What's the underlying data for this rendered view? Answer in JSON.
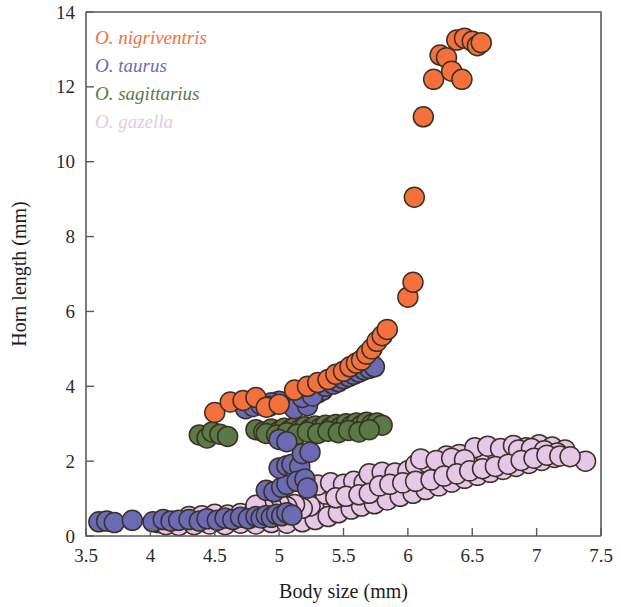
{
  "chart_data": {
    "type": "scatter",
    "title": "",
    "xlabel": "Body size (mm)",
    "ylabel": "Horn length (mm)",
    "xlim": [
      3.5,
      7.5
    ],
    "ylim": [
      0,
      14
    ],
    "xticks": [
      "3.5",
      "4",
      "4.5",
      "5",
      "5.5",
      "6",
      "6.5",
      "7",
      "7.5"
    ],
    "xtick_values": [
      3.5,
      4,
      4.5,
      5,
      5.5,
      6,
      6.5,
      7,
      7.5
    ],
    "yticks": [
      "0",
      "2",
      "4",
      "6",
      "8",
      "10",
      "12",
      "14"
    ],
    "ytick_values": [
      0,
      2,
      4,
      6,
      8,
      10,
      12,
      14
    ],
    "grid": false,
    "legend_position": "top-left",
    "marker_radius_px": 10,
    "marker_stroke": "#3b3026",
    "series": [
      {
        "name": "O. nigriventris",
        "color": "#F4713E",
        "points": [
          [
            4.5,
            3.3
          ],
          [
            4.62,
            3.58
          ],
          [
            4.72,
            3.62
          ],
          [
            4.82,
            3.7
          ],
          [
            4.9,
            3.44
          ],
          [
            5.0,
            3.52
          ],
          [
            5.12,
            3.9
          ],
          [
            5.22,
            4.0
          ],
          [
            5.3,
            4.1
          ],
          [
            5.38,
            4.18
          ],
          [
            5.44,
            4.32
          ],
          [
            5.5,
            4.4
          ],
          [
            5.55,
            4.52
          ],
          [
            5.6,
            4.62
          ],
          [
            5.64,
            4.7
          ],
          [
            5.68,
            4.86
          ],
          [
            5.72,
            5.0
          ],
          [
            5.76,
            5.2
          ],
          [
            5.8,
            5.35
          ],
          [
            5.84,
            5.52
          ],
          [
            6.0,
            6.38
          ],
          [
            6.04,
            6.78
          ],
          [
            6.05,
            9.05
          ],
          [
            6.12,
            11.2
          ],
          [
            6.2,
            12.2
          ],
          [
            6.25,
            12.85
          ],
          [
            6.3,
            12.78
          ],
          [
            6.34,
            12.42
          ],
          [
            6.42,
            12.2
          ],
          [
            6.38,
            13.25
          ],
          [
            6.44,
            13.3
          ],
          [
            6.5,
            13.22
          ],
          [
            6.54,
            13.1
          ],
          [
            6.57,
            13.18
          ]
        ]
      },
      {
        "name": "O. taurus",
        "color": "#6B6BB5",
        "points": [
          [
            3.6,
            0.38
          ],
          [
            3.66,
            0.4
          ],
          [
            3.72,
            0.36
          ],
          [
            3.86,
            0.42
          ],
          [
            4.02,
            0.38
          ],
          [
            4.1,
            0.44
          ],
          [
            4.16,
            0.4
          ],
          [
            4.22,
            0.42
          ],
          [
            4.3,
            0.44
          ],
          [
            4.38,
            0.4
          ],
          [
            4.44,
            0.46
          ],
          [
            4.52,
            0.42
          ],
          [
            4.58,
            0.48
          ],
          [
            4.64,
            0.44
          ],
          [
            4.7,
            0.5
          ],
          [
            4.76,
            0.46
          ],
          [
            4.82,
            0.52
          ],
          [
            4.86,
            0.48
          ],
          [
            4.9,
            0.55
          ],
          [
            4.94,
            0.5
          ],
          [
            4.98,
            0.58
          ],
          [
            5.02,
            0.54
          ],
          [
            5.06,
            0.62
          ],
          [
            5.1,
            0.56
          ],
          [
            4.9,
            1.22
          ],
          [
            4.96,
            1.18
          ],
          [
            5.02,
            1.3
          ],
          [
            5.06,
            1.38
          ],
          [
            5.0,
            1.82
          ],
          [
            5.06,
            1.88
          ],
          [
            5.12,
            1.8
          ],
          [
            5.1,
            1.92
          ],
          [
            5.16,
            1.86
          ],
          [
            5.14,
            1.46
          ],
          [
            5.2,
            1.52
          ],
          [
            5.22,
            1.28
          ],
          [
            5.18,
            2.2
          ],
          [
            5.24,
            2.24
          ],
          [
            5.0,
            2.58
          ],
          [
            5.06,
            2.52
          ],
          [
            5.12,
            3.4
          ],
          [
            5.22,
            3.48
          ],
          [
            5.3,
            3.82
          ],
          [
            5.34,
            3.9
          ],
          [
            5.0,
            3.6
          ],
          [
            4.94,
            3.56
          ],
          [
            5.18,
            3.7
          ],
          [
            5.26,
            3.74
          ],
          [
            5.36,
            4.0
          ],
          [
            5.42,
            4.06
          ],
          [
            5.46,
            4.12
          ],
          [
            5.5,
            4.2
          ],
          [
            5.54,
            4.26
          ],
          [
            5.58,
            4.32
          ],
          [
            5.62,
            4.38
          ],
          [
            5.66,
            4.44
          ],
          [
            5.7,
            4.48
          ],
          [
            5.74,
            4.52
          ],
          [
            4.74,
            3.4
          ],
          [
            4.8,
            3.46
          ],
          [
            4.86,
            3.5
          ],
          [
            4.92,
            3.46
          ]
        ]
      },
      {
        "name": "O. sagittarius",
        "color": "#5A7A45",
        "points": [
          [
            4.38,
            2.7
          ],
          [
            4.44,
            2.62
          ],
          [
            4.48,
            2.78
          ],
          [
            4.54,
            2.72
          ],
          [
            4.6,
            2.66
          ],
          [
            4.82,
            2.84
          ],
          [
            4.88,
            2.78
          ],
          [
            4.94,
            2.86
          ],
          [
            5.0,
            2.8
          ],
          [
            5.04,
            2.88
          ],
          [
            5.08,
            2.82
          ],
          [
            5.12,
            2.9
          ],
          [
            5.16,
            2.84
          ],
          [
            5.2,
            2.92
          ],
          [
            5.24,
            2.86
          ],
          [
            5.28,
            2.94
          ],
          [
            5.32,
            2.88
          ],
          [
            5.36,
            2.96
          ],
          [
            5.4,
            2.9
          ],
          [
            5.44,
            2.98
          ],
          [
            5.48,
            2.92
          ],
          [
            5.52,
            3.0
          ],
          [
            5.56,
            2.94
          ],
          [
            5.6,
            3.02
          ],
          [
            5.64,
            2.96
          ],
          [
            5.68,
            3.04
          ],
          [
            5.72,
            2.98
          ],
          [
            5.76,
            3.02
          ],
          [
            5.8,
            2.96
          ],
          [
            4.9,
            2.74
          ],
          [
            4.98,
            2.7
          ],
          [
            5.06,
            2.76
          ],
          [
            5.14,
            2.72
          ],
          [
            5.22,
            2.78
          ],
          [
            5.3,
            2.74
          ],
          [
            5.38,
            2.8
          ],
          [
            5.46,
            2.76
          ],
          [
            5.54,
            2.82
          ],
          [
            5.62,
            2.78
          ],
          [
            5.7,
            2.84
          ]
        ]
      },
      {
        "name": "O. gazella",
        "color": "#E6C7E8",
        "points": [
          [
            4.06,
            0.36
          ],
          [
            4.14,
            0.38
          ],
          [
            4.2,
            0.34
          ],
          [
            4.26,
            0.4
          ],
          [
            4.32,
            0.36
          ],
          [
            4.38,
            0.42
          ],
          [
            4.44,
            0.38
          ],
          [
            4.5,
            0.44
          ],
          [
            4.56,
            0.4
          ],
          [
            4.62,
            0.46
          ],
          [
            4.68,
            0.42
          ],
          [
            4.74,
            0.48
          ],
          [
            4.8,
            0.44
          ],
          [
            4.86,
            0.5
          ],
          [
            4.92,
            0.46
          ],
          [
            4.98,
            0.52
          ],
          [
            5.04,
            0.48
          ],
          [
            5.1,
            0.54
          ],
          [
            5.16,
            0.5
          ],
          [
            5.22,
            0.56
          ],
          [
            4.3,
            0.52
          ],
          [
            4.4,
            0.54
          ],
          [
            4.5,
            0.58
          ],
          [
            4.6,
            0.56
          ],
          [
            4.7,
            0.6
          ],
          [
            4.8,
            0.62
          ],
          [
            4.9,
            0.64
          ],
          [
            5.0,
            0.66
          ],
          [
            5.1,
            0.68
          ],
          [
            5.2,
            0.7
          ],
          [
            5.26,
            0.64
          ],
          [
            5.32,
            0.72
          ],
          [
            5.3,
            0.88
          ],
          [
            5.36,
            0.92
          ],
          [
            5.42,
            0.86
          ],
          [
            5.48,
            0.96
          ],
          [
            5.54,
            0.9
          ],
          [
            5.6,
            1.0
          ],
          [
            5.66,
            0.94
          ],
          [
            5.72,
            1.04
          ],
          [
            5.36,
            1.12
          ],
          [
            5.44,
            1.18
          ],
          [
            5.52,
            1.14
          ],
          [
            5.6,
            1.22
          ],
          [
            5.68,
            1.18
          ],
          [
            5.76,
            1.26
          ],
          [
            5.84,
            1.22
          ],
          [
            5.92,
            1.3
          ],
          [
            5.3,
            1.36
          ],
          [
            5.4,
            1.42
          ],
          [
            5.5,
            1.38
          ],
          [
            5.58,
            1.46
          ],
          [
            5.66,
            1.42
          ],
          [
            5.74,
            1.5
          ],
          [
            5.82,
            1.46
          ],
          [
            5.9,
            1.54
          ],
          [
            5.96,
            1.5
          ],
          [
            6.02,
            1.58
          ],
          [
            6.08,
            1.54
          ],
          [
            6.14,
            1.62
          ],
          [
            5.7,
            1.66
          ],
          [
            5.8,
            1.7
          ],
          [
            5.9,
            1.68
          ],
          [
            6.0,
            1.74
          ],
          [
            6.1,
            1.7
          ],
          [
            6.2,
            1.78
          ],
          [
            6.3,
            1.74
          ],
          [
            6.4,
            1.82
          ],
          [
            6.06,
            1.9
          ],
          [
            6.16,
            1.94
          ],
          [
            6.26,
            1.88
          ],
          [
            6.36,
            1.96
          ],
          [
            6.46,
            1.9
          ],
          [
            6.56,
            1.98
          ],
          [
            6.66,
            1.92
          ],
          [
            6.76,
            2.0
          ],
          [
            6.3,
            2.14
          ],
          [
            6.4,
            2.18
          ],
          [
            6.5,
            2.12
          ],
          [
            6.6,
            2.2
          ],
          [
            6.7,
            2.14
          ],
          [
            6.8,
            2.22
          ],
          [
            6.9,
            2.16
          ],
          [
            7.0,
            2.24
          ],
          [
            6.52,
            2.36
          ],
          [
            6.62,
            2.4
          ],
          [
            6.72,
            2.34
          ],
          [
            6.82,
            2.42
          ],
          [
            6.92,
            2.36
          ],
          [
            7.02,
            2.44
          ],
          [
            7.12,
            2.38
          ],
          [
            7.22,
            2.3
          ],
          [
            6.1,
            2.06
          ],
          [
            6.22,
            2.02
          ],
          [
            6.34,
            2.08
          ],
          [
            6.44,
            2.04
          ],
          [
            6.86,
            2.3
          ],
          [
            6.96,
            2.34
          ],
          [
            7.06,
            2.28
          ],
          [
            7.16,
            2.22
          ],
          [
            7.38,
            2.0
          ],
          [
            4.12,
            0.3
          ],
          [
            4.22,
            0.28
          ],
          [
            4.34,
            0.3
          ],
          [
            4.46,
            0.32
          ],
          [
            4.58,
            0.3
          ],
          [
            4.7,
            0.34
          ],
          [
            4.82,
            0.32
          ],
          [
            4.94,
            0.36
          ],
          [
            5.06,
            0.34
          ],
          [
            5.18,
            0.38
          ],
          [
            5.28,
            0.44
          ],
          [
            5.38,
            0.52
          ],
          [
            5.46,
            0.62
          ],
          [
            5.56,
            0.72
          ],
          [
            5.64,
            0.8
          ],
          [
            5.74,
            0.86
          ],
          [
            5.84,
            0.96
          ],
          [
            5.94,
            1.06
          ],
          [
            6.04,
            1.14
          ],
          [
            6.14,
            1.24
          ],
          [
            6.24,
            1.34
          ],
          [
            6.34,
            1.44
          ],
          [
            6.44,
            1.54
          ],
          [
            6.54,
            1.62
          ],
          [
            6.64,
            1.7
          ],
          [
            6.74,
            1.78
          ],
          [
            6.84,
            1.86
          ],
          [
            6.94,
            1.94
          ],
          [
            7.04,
            2.02
          ],
          [
            7.14,
            2.1
          ],
          [
            5.24,
            0.8
          ],
          [
            5.18,
            0.74
          ],
          [
            5.12,
            0.84
          ],
          [
            5.06,
            0.78
          ],
          [
            5.0,
            0.86
          ],
          [
            4.94,
            0.8
          ],
          [
            4.88,
            0.76
          ],
          [
            4.82,
            0.82
          ],
          [
            5.44,
            1.02
          ],
          [
            5.52,
            1.06
          ],
          [
            5.62,
            1.1
          ],
          [
            5.7,
            1.14
          ],
          [
            5.78,
            1.34
          ],
          [
            5.86,
            1.38
          ],
          [
            5.96,
            1.42
          ],
          [
            6.06,
            1.46
          ],
          [
            6.18,
            1.5
          ],
          [
            6.28,
            1.6
          ],
          [
            6.38,
            1.66
          ],
          [
            6.48,
            1.74
          ],
          [
            6.58,
            1.8
          ],
          [
            6.68,
            1.86
          ],
          [
            6.78,
            1.92
          ],
          [
            6.88,
            2.02
          ],
          [
            6.98,
            2.08
          ],
          [
            7.08,
            2.16
          ],
          [
            7.18,
            2.14
          ],
          [
            7.26,
            2.12
          ]
        ]
      }
    ]
  },
  "legend": {
    "items": [
      {
        "label": "O. nigriventris",
        "color": "#F4713E"
      },
      {
        "label": "O. taurus",
        "color": "#6B6BB5"
      },
      {
        "label": "O. sagittarius",
        "color": "#5A7A45"
      },
      {
        "label": "O. gazella",
        "color": "#E6C7E8"
      }
    ]
  }
}
